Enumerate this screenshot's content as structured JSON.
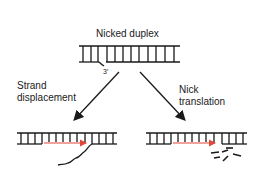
{
  "title": "Nicked duplex",
  "nick_end_label": "3′",
  "left_branch": {
    "line1": "Strand",
    "line2": "displacement"
  },
  "right_branch": {
    "line1": "Nick",
    "line2": "translation"
  },
  "colors": {
    "strand": "#1a1a1a",
    "new_synthesis": "#e0483a",
    "background": "#ffffff"
  }
}
